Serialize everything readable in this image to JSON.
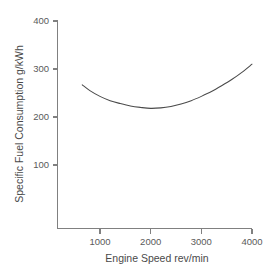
{
  "chart_data": {
    "type": "line",
    "title": "",
    "xlabel": "Engine Speed rev/min",
    "ylabel": "Specific Fuel Consumption g/kWh",
    "xlim": [
      0,
      4050
    ],
    "ylim": [
      0,
      415
    ],
    "grid": false,
    "legend": null,
    "xticks": [
      1000,
      2000,
      3000,
      4000
    ],
    "xtick_labels": [
      "1000",
      "2000",
      "3000",
      "4000"
    ],
    "yticks": [
      100,
      200,
      300,
      400
    ],
    "ytick_labels": [
      "100",
      "200",
      "300",
      "400"
    ],
    "series": [
      {
        "name": "Specific Fuel Consumption",
        "color": "#4a4a4a",
        "x": [
          650,
          800,
          1000,
          1200,
          1400,
          1600,
          1800,
          2000,
          2200,
          2400,
          2600,
          2800,
          3000,
          3200,
          3400,
          3600,
          3800,
          4000
        ],
        "y": [
          267,
          255,
          243,
          234,
          228,
          223,
          220,
          218,
          219,
          222,
          227,
          234,
          243,
          253,
          265,
          278,
          293,
          310
        ]
      }
    ]
  },
  "axes": {
    "x_tick_count": 4,
    "y_tick_count": 4
  }
}
